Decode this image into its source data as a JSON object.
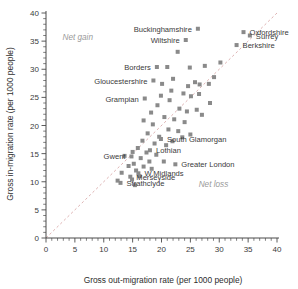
{
  "chart_data": {
    "type": "scatter",
    "title": "",
    "xlabel": "Gross out-migration rate (per 1000 people)",
    "ylabel": "Gross in-migration rate (per 1000 people)",
    "xlim": [
      0,
      40
    ],
    "ylim": [
      0,
      40
    ],
    "xticks": [
      0,
      5,
      10,
      15,
      20,
      25,
      30,
      35,
      40
    ],
    "yticks": [
      0,
      5,
      10,
      15,
      20,
      25,
      30,
      35,
      40
    ],
    "minor_tick_step": 1,
    "grid": false,
    "legend": "none",
    "marker_shape": "square",
    "marker_color": "#8a8a8a",
    "reference_line": {
      "kind": "diagonal-identity",
      "from": [
        0,
        0
      ],
      "to": [
        40,
        40
      ],
      "style": "dashed",
      "color": "#d9a9a9"
    },
    "annotations": [
      {
        "text": "Net gain",
        "x": 5.5,
        "y": 35.2,
        "color": "#9a9a9a"
      },
      {
        "text": "Net loss",
        "x": 29.0,
        "y": 9.0,
        "color": "#9a9a9a"
      }
    ],
    "points": [
      {
        "label": "Buckinghamshire",
        "x": 26.3,
        "y": 37.2,
        "label_side": "left"
      },
      {
        "label": "Wiltshire",
        "x": 24.2,
        "y": 35.2,
        "label_side": "left"
      },
      {
        "label": "Oxfordshire",
        "x": 34.2,
        "y": 36.6,
        "label_side": "right"
      },
      {
        "label": "Surrey",
        "x": 35.3,
        "y": 36.0,
        "label_side": "right"
      },
      {
        "label": "Berkshire",
        "x": 33.0,
        "y": 34.3,
        "label_side": "right"
      },
      {
        "label": "Borders",
        "x": 19.2,
        "y": 30.4,
        "label_side": "left"
      },
      {
        "label": "Gloucestershire",
        "x": 18.6,
        "y": 28.0,
        "label_side": "left"
      },
      {
        "label": "Grampian",
        "x": 17.1,
        "y": 24.8,
        "label_side": "left"
      },
      {
        "label": "South Glamorgan",
        "x": 19.9,
        "y": 17.6,
        "label_side": "right"
      },
      {
        "label": "Lothian",
        "x": 18.0,
        "y": 15.6,
        "label_side": "right"
      },
      {
        "label": "Greater London",
        "x": 22.4,
        "y": 13.1,
        "label_side": "right"
      },
      {
        "label": "Gwent",
        "x": 14.8,
        "y": 14.5,
        "label_side": "left"
      },
      {
        "label": "W.Midlands",
        "x": 16.0,
        "y": 11.5,
        "label_side": "right"
      },
      {
        "label": "Merseyside",
        "x": 14.6,
        "y": 10.9,
        "label_side": "right"
      },
      {
        "label": "Strathclyde",
        "x": 12.9,
        "y": 9.8,
        "label_side": "right"
      },
      {
        "label": "",
        "x": 22.8,
        "y": 33.1
      },
      {
        "label": "",
        "x": 21.0,
        "y": 30.4
      },
      {
        "label": "",
        "x": 27.5,
        "y": 30.6
      },
      {
        "label": "",
        "x": 22.0,
        "y": 28.3
      },
      {
        "label": "",
        "x": 20.1,
        "y": 27.4
      },
      {
        "label": "",
        "x": 24.6,
        "y": 27.0
      },
      {
        "label": "",
        "x": 25.8,
        "y": 27.7
      },
      {
        "label": "",
        "x": 26.6,
        "y": 27.3
      },
      {
        "label": "",
        "x": 28.2,
        "y": 27.4
      },
      {
        "label": "",
        "x": 23.8,
        "y": 25.7
      },
      {
        "label": "",
        "x": 25.1,
        "y": 25.2
      },
      {
        "label": "",
        "x": 26.5,
        "y": 25.6
      },
      {
        "label": "",
        "x": 21.4,
        "y": 24.5
      },
      {
        "label": "",
        "x": 19.3,
        "y": 23.6
      },
      {
        "label": "",
        "x": 23.1,
        "y": 23.0
      },
      {
        "label": "",
        "x": 24.4,
        "y": 22.5
      },
      {
        "label": "",
        "x": 26.1,
        "y": 22.8
      },
      {
        "label": "",
        "x": 20.5,
        "y": 21.5
      },
      {
        "label": "",
        "x": 22.2,
        "y": 21.1
      },
      {
        "label": "",
        "x": 24.0,
        "y": 20.6
      },
      {
        "label": "",
        "x": 18.5,
        "y": 20.2
      },
      {
        "label": "",
        "x": 21.2,
        "y": 19.3
      },
      {
        "label": "",
        "x": 22.9,
        "y": 19.0
      },
      {
        "label": "",
        "x": 17.6,
        "y": 18.6
      },
      {
        "label": "",
        "x": 19.6,
        "y": 18.0
      },
      {
        "label": "",
        "x": 16.7,
        "y": 17.3
      },
      {
        "label": "",
        "x": 18.8,
        "y": 16.8
      },
      {
        "label": "",
        "x": 20.8,
        "y": 16.5
      },
      {
        "label": "",
        "x": 15.9,
        "y": 16.0
      },
      {
        "label": "",
        "x": 17.4,
        "y": 15.2
      },
      {
        "label": "",
        "x": 19.1,
        "y": 14.8
      },
      {
        "label": "",
        "x": 16.4,
        "y": 14.2
      },
      {
        "label": "",
        "x": 17.9,
        "y": 13.6
      },
      {
        "label": "",
        "x": 15.2,
        "y": 13.2
      },
      {
        "label": "",
        "x": 16.9,
        "y": 12.7
      },
      {
        "label": "",
        "x": 18.3,
        "y": 12.3
      },
      {
        "label": "",
        "x": 15.6,
        "y": 12.0
      },
      {
        "label": "",
        "x": 14.3,
        "y": 12.8
      },
      {
        "label": "",
        "x": 16.2,
        "y": 11.0
      },
      {
        "label": "",
        "x": 14.9,
        "y": 10.4
      },
      {
        "label": "",
        "x": 15.4,
        "y": 9.4
      },
      {
        "label": "",
        "x": 13.6,
        "y": 14.6
      },
      {
        "label": "",
        "x": 15.0,
        "y": 15.3
      },
      {
        "label": "",
        "x": 21.9,
        "y": 17.2
      },
      {
        "label": "",
        "x": 23.6,
        "y": 17.9
      },
      {
        "label": "",
        "x": 25.0,
        "y": 18.4
      },
      {
        "label": "",
        "x": 28.4,
        "y": 24.0
      },
      {
        "label": "",
        "x": 27.0,
        "y": 21.9
      },
      {
        "label": "",
        "x": 29.1,
        "y": 28.6
      },
      {
        "label": "",
        "x": 30.2,
        "y": 31.2
      },
      {
        "label": "",
        "x": 24.9,
        "y": 30.3
      },
      {
        "label": "",
        "x": 21.7,
        "y": 26.2
      },
      {
        "label": "",
        "x": 19.9,
        "y": 25.3
      },
      {
        "label": "",
        "x": 18.2,
        "y": 22.3
      },
      {
        "label": "",
        "x": 16.9,
        "y": 20.9
      },
      {
        "label": "",
        "x": 13.1,
        "y": 11.6
      },
      {
        "label": "",
        "x": 12.4,
        "y": 10.2
      },
      {
        "label": "",
        "x": 20.4,
        "y": 13.6
      }
    ]
  }
}
